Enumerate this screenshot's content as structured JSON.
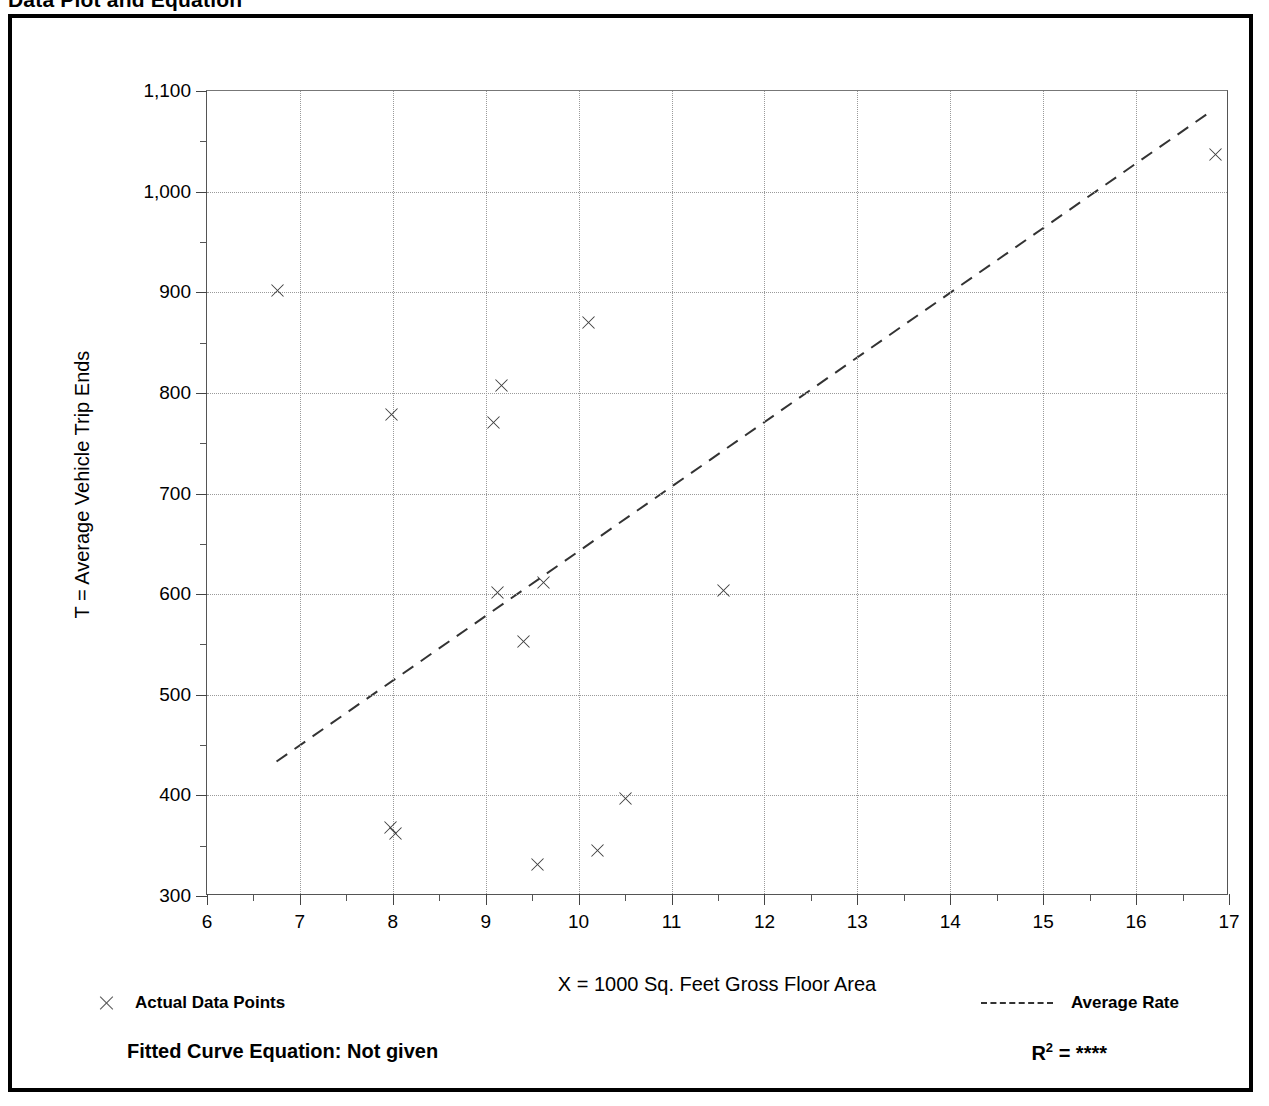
{
  "page_title": "Data Plot and Equation",
  "chart_data": {
    "type": "scatter",
    "title": "Data Plot and Equation",
    "xlabel": "X = 1000 Sq. Feet Gross Floor Area",
    "ylabel": "T = Average Vehicle Trip Ends",
    "xlim": [
      6,
      17
    ],
    "ylim": [
      300,
      1100
    ],
    "x_ticks": [
      "6",
      "7",
      "8",
      "9",
      "10",
      "11",
      "12",
      "13",
      "14",
      "15",
      "16",
      "17"
    ],
    "x_tick_values": [
      6,
      7,
      8,
      9,
      10,
      11,
      12,
      13,
      14,
      15,
      16,
      17
    ],
    "x_minor_step": 0.5,
    "y_ticks": [
      "300",
      "400",
      "500",
      "600",
      "700",
      "800",
      "900",
      "1,000",
      "1,100"
    ],
    "y_tick_values": [
      300,
      400,
      500,
      600,
      700,
      800,
      900,
      1000,
      1100
    ],
    "y_minor_step": 50,
    "grid": true,
    "grid_style": "dotted",
    "marker": "x",
    "series": [
      {
        "name": "Actual Data Points",
        "marker": "x",
        "points": [
          {
            "x": 6.75,
            "y": 902
          },
          {
            "x": 7.98,
            "y": 779
          },
          {
            "x": 7.97,
            "y": 368
          },
          {
            "x": 8.02,
            "y": 362
          },
          {
            "x": 9.08,
            "y": 771
          },
          {
            "x": 9.16,
            "y": 807
          },
          {
            "x": 9.12,
            "y": 602
          },
          {
            "x": 9.4,
            "y": 553
          },
          {
            "x": 9.55,
            "y": 331
          },
          {
            "x": 9.62,
            "y": 612
          },
          {
            "x": 10.1,
            "y": 870
          },
          {
            "x": 10.2,
            "y": 345
          },
          {
            "x": 10.5,
            "y": 397
          },
          {
            "x": 11.55,
            "y": 604
          },
          {
            "x": 16.85,
            "y": 1037
          }
        ]
      }
    ],
    "trend_line": {
      "name": "Average Rate",
      "style": "dashed",
      "from": {
        "x": 6.75,
        "y": 432
      },
      "to": {
        "x": 16.8,
        "y": 1078
      }
    },
    "annotations": {
      "fitted_curve_equation": "Fitted Curve Equation:  Not given",
      "r_squared_label": "R",
      "r_squared_exponent": "2",
      "r_squared_value": "= ****"
    }
  },
  "legend": {
    "data_points_label": "Actual Data Points",
    "average_rate_label": "Average Rate",
    "data_points_icon": "x-marker-icon",
    "average_rate_icon": "dashed-line-icon"
  },
  "colors": {
    "frame": "#000000",
    "grid": "#9a9a9a",
    "marker": "#3c3c3c",
    "trend": "#333333",
    "text": "#000000"
  }
}
